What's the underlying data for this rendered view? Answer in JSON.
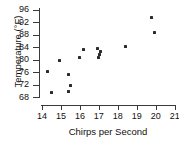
{
  "chart_data": {
    "type": "scatter",
    "title": "",
    "xlabel": "Chirps per Second",
    "ylabel": "Temperature (°F)",
    "xlim": [
      14,
      21
    ],
    "ylim": [
      68,
      96
    ],
    "xticks": [
      14,
      15,
      16,
      17,
      18,
      19,
      20,
      21
    ],
    "yticks": [
      68,
      72,
      76,
      80,
      84,
      88,
      92,
      96
    ],
    "grid": false,
    "legend": null,
    "marker_color": "#2b2b2b",
    "axis_color": "#3a3a3a",
    "points": [
      {
        "x": 14.3,
        "y": 76.2
      },
      {
        "x": 14.5,
        "y": 69.4
      },
      {
        "x": 14.9,
        "y": 79.6
      },
      {
        "x": 15.4,
        "y": 75.2
      },
      {
        "x": 15.4,
        "y": 69.7
      },
      {
        "x": 15.5,
        "y": 71.6
      },
      {
        "x": 16.0,
        "y": 80.6
      },
      {
        "x": 16.2,
        "y": 83.3
      },
      {
        "x": 16.95,
        "y": 83.5
      },
      {
        "x": 17.1,
        "y": 82.6
      },
      {
        "x": 17.05,
        "y": 81.7
      },
      {
        "x": 17.0,
        "y": 80.6
      },
      {
        "x": 18.4,
        "y": 84.3
      },
      {
        "x": 19.8,
        "y": 93.3
      },
      {
        "x": 19.95,
        "y": 88.6
      }
    ]
  },
  "axes": {
    "x_tick_labels": [
      "14",
      "15",
      "16",
      "17",
      "18",
      "19",
      "20",
      "21"
    ],
    "y_tick_labels": [
      "68",
      "72",
      "76",
      "80",
      "84",
      "88",
      "92",
      "96"
    ],
    "x_title": "Chirps per Second",
    "y_title": "Temperature (°F)"
  }
}
